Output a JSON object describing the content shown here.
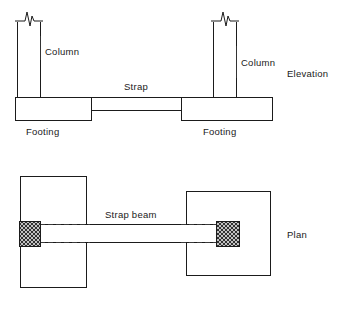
{
  "figure": {
    "background_color": "#ffffff",
    "line_color": "#1b1b1b",
    "hatch_color": "#4a4a4a",
    "dashed_color": "#3a3a3a"
  },
  "elevation": {
    "view_label": "Elevation",
    "left_column_label": "Column",
    "right_column_label": "Column",
    "strap_label": "Strap",
    "left_footing_label": "Footing",
    "right_footing_label": "Footing",
    "break_symbol_name": "break-line"
  },
  "plan": {
    "view_label": "Plan",
    "strap_beam_label": "Strap beam",
    "left_column_section_name": "hatched-column-section",
    "right_column_section_name": "hatched-column-section"
  }
}
